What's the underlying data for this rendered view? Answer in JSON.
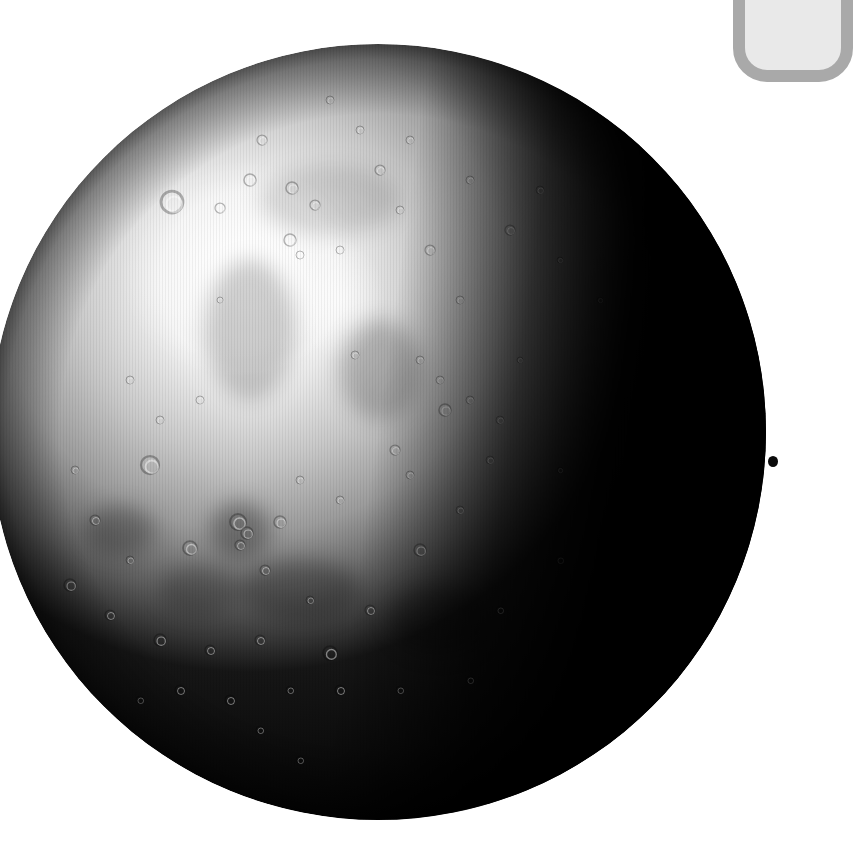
{
  "image": {
    "subject": "Cratered planet with terminator shadow",
    "alt": "Grayscale illustration of a cratered planet, lit from the upper left with its right side in deep shadow"
  },
  "planet": {
    "cx": 378,
    "cy": 432,
    "r": 388,
    "colors": {
      "highlight": "#ffffff",
      "light": "#d6d6d6",
      "mid": "#9a9a9a",
      "dark": "#4a4a4a",
      "shadow": "#050505",
      "limb": "#2a2a2a"
    },
    "highlight_center": [
      250,
      280
    ],
    "maria": [
      {
        "cx": 250,
        "cy": 330,
        "rx": 45,
        "ry": 70,
        "opacity": 0.18
      },
      {
        "cx": 380,
        "cy": 370,
        "rx": 40,
        "ry": 50,
        "opacity": 0.2
      },
      {
        "cx": 120,
        "cy": 530,
        "rx": 35,
        "ry": 25,
        "opacity": 0.25
      },
      {
        "cx": 240,
        "cy": 530,
        "rx": 30,
        "ry": 28,
        "opacity": 0.3
      },
      {
        "cx": 300,
        "cy": 590,
        "rx": 60,
        "ry": 30,
        "opacity": 0.25
      },
      {
        "cx": 440,
        "cy": 620,
        "rx": 50,
        "ry": 35,
        "opacity": 0.22
      },
      {
        "cx": 200,
        "cy": 590,
        "rx": 40,
        "ry": 25,
        "opacity": 0.2
      },
      {
        "cx": 330,
        "cy": 200,
        "rx": 70,
        "ry": 35,
        "opacity": 0.12
      }
    ],
    "craters": [
      [
        172,
        202,
        11
      ],
      [
        220,
        208,
        5
      ],
      [
        250,
        180,
        6
      ],
      [
        262,
        140,
        5
      ],
      [
        292,
        188,
        6
      ],
      [
        315,
        205,
        5
      ],
      [
        290,
        240,
        6
      ],
      [
        300,
        255,
        4
      ],
      [
        340,
        250,
        4
      ],
      [
        150,
        465,
        9
      ],
      [
        190,
        548,
        7
      ],
      [
        238,
        522,
        8
      ],
      [
        247,
        533,
        6
      ],
      [
        280,
        522,
        6
      ],
      [
        240,
        545,
        5
      ],
      [
        70,
        585,
        6
      ],
      [
        110,
        615,
        5
      ],
      [
        160,
        640,
        6
      ],
      [
        210,
        650,
        5
      ],
      [
        260,
        640,
        5
      ],
      [
        330,
        653,
        7
      ],
      [
        340,
        690,
        5
      ],
      [
        400,
        690,
        4
      ],
      [
        420,
        550,
        6
      ],
      [
        445,
        410,
        6
      ],
      [
        470,
        400,
        4
      ],
      [
        440,
        380,
        4
      ],
      [
        355,
        355,
        4
      ],
      [
        420,
        360,
        4
      ],
      [
        395,
        450,
        5
      ],
      [
        410,
        475,
        4
      ],
      [
        300,
        480,
        4
      ],
      [
        340,
        500,
        4
      ],
      [
        265,
        570,
        5
      ],
      [
        310,
        600,
        4
      ],
      [
        370,
        610,
        5
      ],
      [
        460,
        510,
        4
      ],
      [
        490,
        460,
        4
      ],
      [
        500,
        420,
        4
      ],
      [
        520,
        360,
        3
      ],
      [
        540,
        190,
        4
      ],
      [
        510,
        230,
        5
      ],
      [
        470,
        180,
        4
      ],
      [
        560,
        260,
        3
      ],
      [
        600,
        300,
        3
      ],
      [
        160,
        420,
        4
      ],
      [
        130,
        380,
        4
      ],
      [
        200,
        400,
        4
      ],
      [
        220,
        300,
        3
      ],
      [
        380,
        170,
        5
      ],
      [
        410,
        140,
        4
      ],
      [
        360,
        130,
        4
      ],
      [
        330,
        100,
        4
      ],
      [
        400,
        210,
        4
      ],
      [
        430,
        250,
        5
      ],
      [
        460,
        300,
        4
      ],
      [
        260,
        730,
        4
      ],
      [
        300,
        760,
        4
      ],
      [
        230,
        700,
        5
      ],
      [
        290,
        690,
        4
      ],
      [
        180,
        690,
        5
      ],
      [
        140,
        700,
        4
      ],
      [
        75,
        470,
        4
      ],
      [
        95,
        520,
        5
      ],
      [
        130,
        560,
        4
      ],
      [
        560,
        470,
        3
      ],
      [
        560,
        560,
        4
      ],
      [
        500,
        610,
        4
      ],
      [
        470,
        680,
        4
      ]
    ]
  },
  "corner_box": {
    "border_color": "#a9a9a9",
    "fill_color": "#e9e9e9"
  },
  "edge_dot": {
    "color": "#0a0a0a",
    "cx": 773,
    "cy": 461
  }
}
